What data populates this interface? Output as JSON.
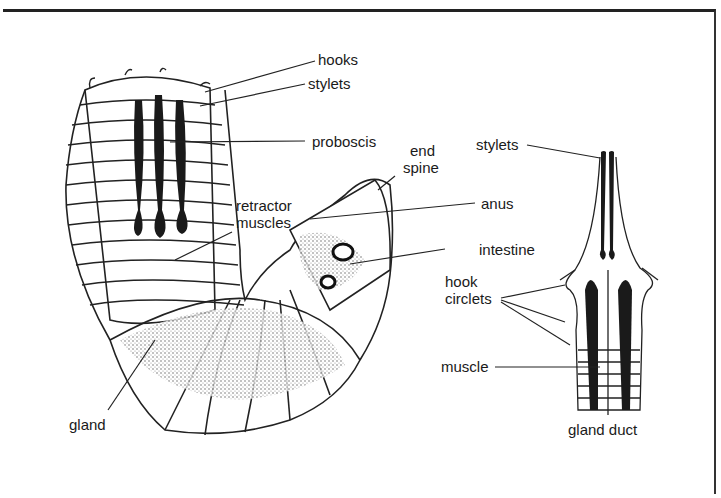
{
  "diagram": {
    "left_figure": {
      "labels": {
        "hooks": "hooks",
        "stylets": "stylets",
        "proboscis": "proboscis",
        "end_spine_1": "end",
        "end_spine_2": "spine",
        "retractor_1": "retractor",
        "retractor_2": "muscles",
        "anus": "anus",
        "intestine": "intestine",
        "gland": "gland"
      }
    },
    "right_figure": {
      "labels": {
        "stylets": "stylets",
        "hook_circlets_1": "hook",
        "hook_circlets_2": "circlets",
        "muscle": "muscle",
        "gland_duct": "gland duct"
      }
    }
  }
}
